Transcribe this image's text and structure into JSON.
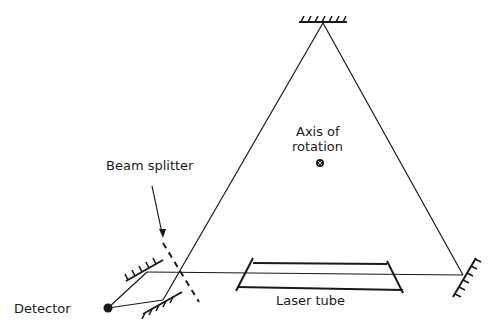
{
  "diagram": {
    "type": "ring laser gyroscope schematic",
    "labels": {
      "beam_splitter": "Beam splitter",
      "axis_line1": "Axis of",
      "axis_line2": "rotation",
      "laser_tube": "Laser tube",
      "detector": "Detector"
    },
    "components": [
      "top mirror",
      "right mirror",
      "left mirror",
      "lower mirror",
      "beam splitter",
      "laser tube",
      "detector",
      "axis of rotation"
    ],
    "colors": {
      "ink": "#1a1a1a",
      "background": "#ffffff"
    }
  }
}
